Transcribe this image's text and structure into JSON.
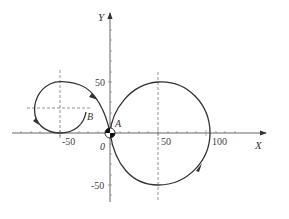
{
  "diagram": {
    "type": "trajectory-plot",
    "axes": {
      "x_label": "X",
      "y_label": "Y",
      "origin_label": "0",
      "x_ticks": [
        "-50",
        "50",
        "100"
      ],
      "y_ticks": [
        "50",
        "-50"
      ]
    },
    "points": {
      "A": "A",
      "B": "B"
    },
    "curves": [
      {
        "name": "large-circle",
        "center": [
          50,
          0
        ],
        "radius": 50,
        "direction": "clockwise"
      },
      {
        "name": "small-loop",
        "center": [
          -50,
          25
        ],
        "radius": 25,
        "end_point": "B"
      }
    ],
    "colors": {
      "curve": "#333333",
      "axis": "#444444",
      "dashed": "#666666"
    }
  }
}
